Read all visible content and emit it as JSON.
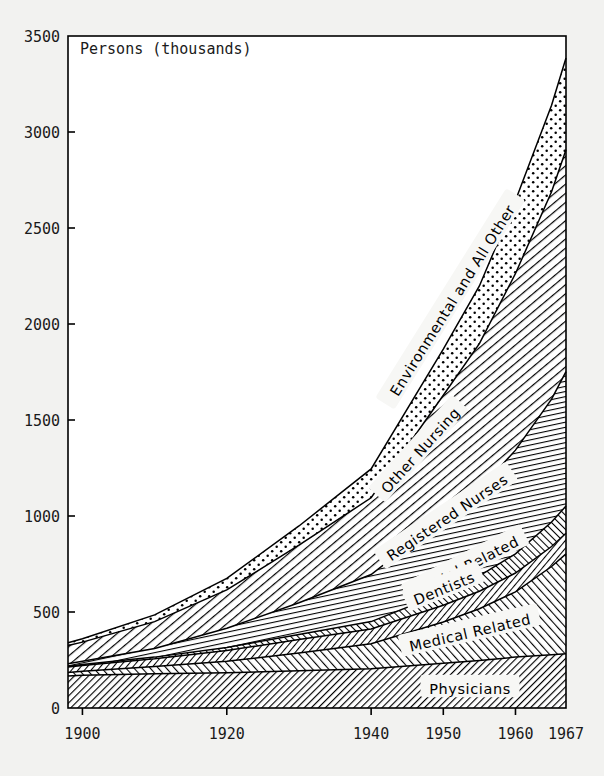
{
  "chart_data": {
    "type": "area",
    "title": "Persons (thousands)",
    "xlabel": "",
    "ylabel": "Persons (thousands)",
    "ylim": [
      0,
      3500
    ],
    "xlim": [
      1898,
      1967
    ],
    "yticks": [
      0,
      500,
      1000,
      1500,
      2000,
      2500,
      3000,
      3500
    ],
    "ytick_labels": [
      "0",
      "500",
      "1000",
      "1500",
      "2000",
      "2500",
      "3000",
      "3500"
    ],
    "xticks": [
      1900,
      1920,
      1940,
      1950,
      1960,
      1967
    ],
    "xtick_labels": [
      "1900",
      "1920",
      "1940",
      "1950",
      "1960",
      "1967"
    ],
    "grid": false,
    "legend_position": "inline-band-labels",
    "stacked": true,
    "x": [
      1898,
      1900,
      1910,
      1920,
      1930,
      1940,
      1950,
      1955,
      1960,
      1965,
      1967
    ],
    "series": [
      {
        "name": "Physicians",
        "fill": "hatch-physicians",
        "values": [
          167,
          170,
          178,
          183,
          194,
          205,
          233,
          247,
          265,
          277,
          283
        ]
      },
      {
        "name": "Medical Related",
        "fill": "hatch-medical",
        "values": [
          18,
          22,
          38,
          60,
          92,
          130,
          215,
          270,
          340,
          460,
          520
        ]
      },
      {
        "name": "Dentists",
        "fill": "hatch-dentists",
        "values": [
          29,
          30,
          40,
          56,
          71,
          77,
          87,
          91,
          98,
          104,
          107
        ]
      },
      {
        "name": "Dental Related",
        "fill": "hatch-dentalrel",
        "values": [
          4,
          5,
          9,
          16,
          26,
          38,
          64,
          80,
          100,
          128,
          142
        ]
      },
      {
        "name": "Registered Nurses",
        "fill": "hatch-regnurses",
        "values": [
          12,
          16,
          45,
          100,
          165,
          245,
          390,
          450,
          540,
          640,
          700
        ]
      },
      {
        "name": "Other Nursing",
        "fill": "hatch-othernursing",
        "values": [
          95,
          100,
          140,
          200,
          300,
          400,
          640,
          760,
          920,
          1080,
          1155
        ]
      },
      {
        "name": "Environmental and All Other",
        "fill": "dots-environmental",
        "values": [
          15,
          18,
          35,
          60,
          100,
          150,
          240,
          300,
          380,
          450,
          478
        ]
      }
    ],
    "totals": [
      340,
      361,
      485,
      675,
      948,
      1245,
      1869,
      2198,
      2643,
      3139,
      3385
    ]
  },
  "axes": {
    "y_title": "Persons (thousands)"
  },
  "band_labels": [
    {
      "name": "Environmental and All Other",
      "text": "Environmental and All Other"
    },
    {
      "name": "Other Nursing",
      "text": "Other Nursing"
    },
    {
      "name": "Registered Nurses",
      "text": "Registered Nurses"
    },
    {
      "name": "Dental Related",
      "text": "Dental Related"
    },
    {
      "name": "Dentists",
      "text": "Dentists"
    },
    {
      "name": "Medical Related",
      "text": "Medical Related"
    },
    {
      "name": "Physicians",
      "text": "Physicians"
    }
  ],
  "colors": {
    "ink": "#000000",
    "paper": "#f2f2f0",
    "plot_bg": "#ffffff"
  }
}
